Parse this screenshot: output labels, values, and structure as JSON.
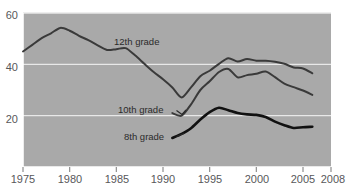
{
  "chart_data": {
    "type": "line",
    "title": "",
    "subtitle": "",
    "xlabel": "",
    "ylabel": "",
    "xlim": [
      1975,
      2008
    ],
    "ylim": [
      0,
      60
    ],
    "grid": true,
    "gridlines_y": [
      20,
      40,
      60
    ],
    "legend_position": "inline-annotation",
    "x_ticks": [
      1975,
      1980,
      1985,
      1990,
      1995,
      2000,
      2005,
      2008
    ],
    "x_tick_labels": [
      "1975",
      "1980",
      "1985",
      "1990",
      "1995",
      "2000",
      "2005",
      "2008"
    ],
    "y_ticks": [
      20,
      40,
      60
    ],
    "y_tick_labels": [
      "20",
      "40",
      "60"
    ],
    "background_color": "#a9a9a9",
    "gridline_color": "#e8e8e8",
    "series": [
      {
        "name": "12th grade",
        "label": "12th grade",
        "color": "#3a3a3a",
        "width": 2.0,
        "x": [
          1975,
          1976,
          1977,
          1978,
          1979,
          1980,
          1981,
          1982,
          1983,
          1984,
          1985,
          1986,
          1987,
          1988,
          1989,
          1990,
          1991,
          1992,
          1993,
          1994,
          1995,
          1996,
          1997,
          1998,
          1999,
          2000,
          2001,
          2002,
          2003,
          2004,
          2005,
          2006
        ],
        "values": [
          45.0,
          47.6,
          50.2,
          52.1,
          54.2,
          53.1,
          51.1,
          49.4,
          47.4,
          45.6,
          45.9,
          46.3,
          43.5,
          40.2,
          37.0,
          34.2,
          31.0,
          27.1,
          31.0,
          35.4,
          37.5,
          40.2,
          42.4,
          41.1,
          42.1,
          41.4,
          41.4,
          41.0,
          40.2,
          38.8,
          38.4,
          36.5
        ],
        "marker": "none"
      },
      {
        "name": "10th grade",
        "label": "10th grade",
        "color": "#3a3a3a",
        "width": 2.0,
        "x": [
          1991,
          1992,
          1993,
          1994,
          1995,
          1996,
          1997,
          1998,
          1999,
          2000,
          2001,
          2002,
          2003,
          2004,
          2005,
          2006
        ],
        "values": [
          21.0,
          20.0,
          24.4,
          30.0,
          33.4,
          37.0,
          38.2,
          34.9,
          35.8,
          36.3,
          37.2,
          35.0,
          32.5,
          31.1,
          29.8,
          28.1
        ],
        "marker": "none"
      },
      {
        "name": "8th grade",
        "label": "8th grade",
        "color": "#111111",
        "width": 2.6,
        "x": [
          1991,
          1992,
          1993,
          1994,
          1995,
          1996,
          1997,
          1998,
          1999,
          2000,
          2001,
          2002,
          2003,
          2004,
          2005,
          2006
        ],
        "values": [
          11.3,
          12.9,
          15.1,
          18.5,
          21.4,
          23.1,
          22.1,
          21.0,
          20.5,
          20.3,
          19.5,
          17.7,
          16.3,
          15.2,
          15.5,
          15.7
        ],
        "marker": "none"
      }
    ],
    "annotations": [
      {
        "text": "12th grade",
        "x": 1988,
        "y": 48,
        "name": "series-label-12th-grade"
      },
      {
        "text": "10th grade",
        "x": 1988,
        "y": 23.5,
        "name": "series-label-10th-grade"
      },
      {
        "text": "8th grade",
        "x": 1989.5,
        "y": 13.0,
        "name": "series-label-8th-grade"
      }
    ]
  }
}
